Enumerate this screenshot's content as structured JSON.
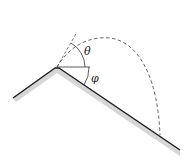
{
  "diagram": {
    "type": "projectile-on-incline",
    "labels": {
      "launch_angle": "θ",
      "slope_angle": "φ"
    },
    "colors": {
      "surface": "#1a1a1a",
      "shadow": "#d4d4d4",
      "trajectory": "#555555",
      "reference": "#333333"
    }
  }
}
